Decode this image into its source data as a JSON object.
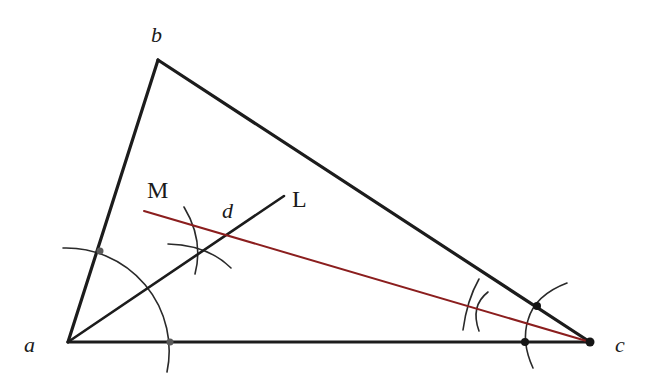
{
  "diagram": {
    "colors": {
      "edges": "#1c1c1c",
      "construction_arcs": "#2a2a2a",
      "red_line": "#8b1e1e",
      "background": "#ffffff"
    },
    "labels": {
      "a": "a",
      "b": "b",
      "c": "c",
      "d": "d",
      "M": "M",
      "L": "L"
    },
    "points": {
      "a": [
        68,
        342
      ],
      "b": [
        158,
        60
      ],
      "c": [
        590,
        342
      ],
      "L": [
        284,
        196
      ],
      "M_start": [
        144,
        211
      ],
      "d": [
        226,
        234
      ]
    },
    "elements": [
      {
        "type": "segment",
        "from": "a",
        "to": "b",
        "name": "side-ab"
      },
      {
        "type": "segment",
        "from": "b",
        "to": "c",
        "name": "side-bc"
      },
      {
        "type": "segment",
        "from": "a",
        "to": "c",
        "name": "side-ac"
      },
      {
        "type": "ray",
        "from": "a",
        "to": "L",
        "name": "bisector-aL"
      },
      {
        "type": "segment",
        "from": "M",
        "to": "c",
        "name": "red-line-Mc"
      },
      {
        "type": "arc",
        "center": "a",
        "name": "arc-at-a"
      },
      {
        "type": "arc",
        "center": "c",
        "name": "arc-at-c"
      }
    ]
  }
}
